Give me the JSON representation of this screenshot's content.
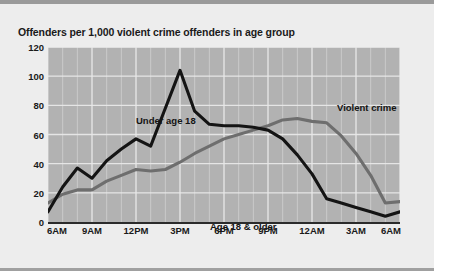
{
  "chart_title": "Offenders per 1,000 violent crime offenders in age group",
  "annotations": {
    "series_under_18": "Under age 18",
    "series_18_older": "Age 18 & older",
    "crime_type": "Violent crime"
  },
  "axis": {
    "y_ticks": [
      "0",
      "20",
      "40",
      "60",
      "80",
      "100",
      "120"
    ],
    "x_ticks": [
      "6AM",
      "9AM",
      "12PM",
      "3PM",
      "6PM",
      "9PM",
      "12AM",
      "3AM",
      "6AM"
    ]
  },
  "colors": {
    "under_18_line": "#141414",
    "age_18_older_line": "#6e6e6e",
    "plot_background": "#b2b2b2",
    "gridline": "#e8e8e8",
    "panel_background": "#ededed",
    "text": "#1a1a1a"
  },
  "chart_data": {
    "type": "line",
    "title": "Offenders per 1,000 violent crime offenders in age group",
    "xlabel": "",
    "ylabel": "Offenders per 1,000 violent crime offenders in age group",
    "ylim": [
      0,
      120
    ],
    "yticks": [
      0,
      20,
      40,
      60,
      80,
      100,
      120
    ],
    "grid": true,
    "legend_position": "inline-annotations",
    "x": [
      "6AM",
      "7AM",
      "8AM",
      "9AM",
      "10AM",
      "11AM",
      "12PM",
      "1PM",
      "2PM",
      "3PM",
      "4PM",
      "5PM",
      "6PM",
      "7PM",
      "8PM",
      "9PM",
      "10PM",
      "11PM",
      "12AM",
      "1AM",
      "2AM",
      "3AM",
      "4AM",
      "5AM",
      "6AM"
    ],
    "xtick_labels": [
      "6AM",
      "9AM",
      "12PM",
      "3PM",
      "6PM",
      "9PM",
      "12AM",
      "3AM",
      "6AM"
    ],
    "series": [
      {
        "name": "Under age 18",
        "color": "#141414",
        "values": [
          7,
          24,
          37,
          30,
          42,
          50,
          57,
          52,
          78,
          104,
          76,
          67,
          66,
          66,
          65,
          63,
          57,
          46,
          33,
          16,
          13,
          10,
          7,
          4,
          7
        ]
      },
      {
        "name": "Age 18 & older",
        "color": "#6e6e6e",
        "values": [
          13,
          19,
          22,
          22,
          28,
          32,
          36,
          35,
          36,
          41,
          47,
          52,
          57,
          60,
          63,
          66,
          70,
          71,
          69,
          68,
          59,
          47,
          32,
          13,
          14
        ]
      }
    ],
    "annotations": [
      {
        "text": "Violent crime",
        "x": "12AM",
        "y": 112
      },
      {
        "text": "Under age 18",
        "x": "11AM",
        "y": 100
      },
      {
        "text": "Age 18 & older",
        "x": "5PM",
        "y": 28
      }
    ]
  }
}
